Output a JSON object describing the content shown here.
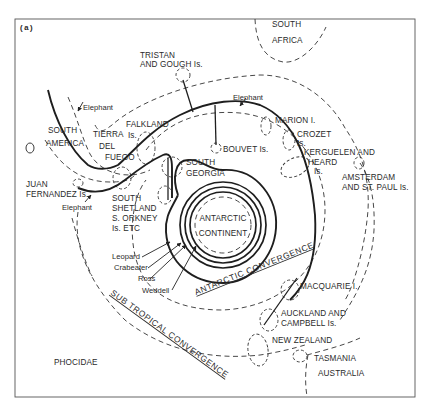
{
  "figure": {
    "panel_label": "(a)",
    "title": "PHOCIDAE",
    "center_region": [
      "ANTARCTIC",
      "CONTINENT"
    ],
    "convergences": {
      "antarctic": "ANTARCTIC CONVERGENCE",
      "subtropical": "SUB TROPICAL CONVERGENCE"
    },
    "landmasses": {
      "south_africa": [
        "SOUTH",
        "AFRICA"
      ],
      "south_america": [
        "SOUTH",
        "AMERICA"
      ],
      "tierra_del_fuego": [
        "TIERRA",
        "DEL",
        "FUEGO"
      ],
      "new_zealand": "NEW ZEALAND",
      "tasmania": "TASMANIA",
      "australia": "AUSTRALIA"
    },
    "islands": {
      "tristan": [
        "TRISTAN",
        "AND GOUGH Is."
      ],
      "falkland": [
        "FALKLAND",
        "Is."
      ],
      "south_georgia": [
        "SOUTH",
        "GEORGIA"
      ],
      "bouvet": "BOUVET Is.",
      "marion": "MARION I.",
      "crozet": [
        "CROZET",
        "Is."
      ],
      "kerguelen": [
        "KERGUELEN AND",
        "HEARD",
        "Is."
      ],
      "amsterdam": [
        "AMSTERDAM",
        "AND ST. PAUL Is."
      ],
      "juan_fernandez": [
        "JUAN",
        "FERNANDEZ Is."
      ],
      "south_shetland": [
        "SOUTH",
        "SHETLAND",
        "S. ORKNEY",
        "Is. ETC"
      ],
      "macquarie": "MACQUARIE I.",
      "auckland": [
        "AUCKLAND AND",
        "CAMPBELL Is."
      ]
    },
    "species": {
      "elephant": "Elephant",
      "leopard": "Leopard",
      "crabeater": "Crabeater",
      "ross": "Ross",
      "weddell": "Weddell"
    },
    "elephant_label_count": 3
  }
}
